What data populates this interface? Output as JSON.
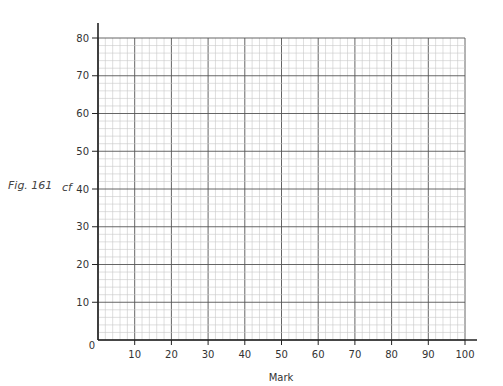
{
  "figure": {
    "label": "Fig. 161"
  },
  "chart_data": {
    "type": "line",
    "title": "",
    "xlabel": "Mark",
    "ylabel": "cf",
    "xlim": [
      0,
      100
    ],
    "ylim": [
      0,
      80
    ],
    "x_ticks": [
      10,
      20,
      30,
      40,
      50,
      60,
      70,
      80,
      90,
      100
    ],
    "y_ticks": [
      0,
      10,
      20,
      30,
      40,
      50,
      60,
      70,
      80
    ],
    "origin_label": "0",
    "grid": true,
    "grid_minor_step": 2,
    "grid_major_step": 10,
    "series": [],
    "note": "Blank cumulative frequency graph paper; no data plotted"
  },
  "colors": {
    "axis": "#222222",
    "grid_minor": "#c8c8c8",
    "grid_mid": "#9a9a9a",
    "grid_major": "#555555"
  }
}
